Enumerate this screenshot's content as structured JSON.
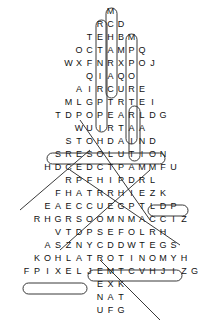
{
  "puzzle": {
    "type": "word-search",
    "shape": "tree",
    "rows": [
      "M",
      "RCD",
      "TEHBM",
      "OCTAMPQ",
      "WXFNRXPOJ",
      "QIAQO",
      "AIRCURE",
      "MLGPTRTEI",
      "TDPOPEARLDG",
      "WUIRTAA",
      "STOHDAIND",
      "SRESOLUTION",
      "HDCEDCTPAMMFU",
      "RPFHIPDRL",
      "FHATRRHIEZK",
      "EAECCUEGPTLDP",
      "RHGRSOOMNMACCIZ",
      "VTDPSEFOLRH",
      "ASZNYCDDWTEGS",
      "KOHLATROTINOMYH",
      "FPIXELJEMTCVHJIZG",
      "EXK",
      "NAT",
      "UFG"
    ],
    "found_words_visible": [
      "RESOLUTION",
      "PIXEL",
      "MONITOR",
      "PEARL"
    ]
  }
}
